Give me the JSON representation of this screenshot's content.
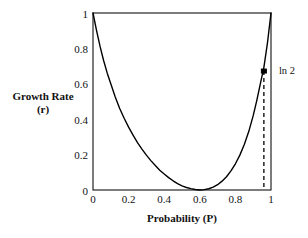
{
  "chart_data": {
    "type": "line",
    "title": "",
    "xlabel": "Probability (P)",
    "ylabel_line1": "Growth Rate",
    "ylabel_line2": "(r)",
    "xlim": [
      0,
      1
    ],
    "ylim": [
      0,
      1
    ],
    "grid": false,
    "legend": "none",
    "x_ticks": [
      "0",
      "0.2",
      "0.4",
      "0.6",
      "0.8",
      "1"
    ],
    "x_tick_values": [
      0,
      0.2,
      0.4,
      0.6,
      0.8,
      1
    ],
    "y_ticks": [
      "0",
      "0.2",
      "0.4",
      "0.6",
      "0.8",
      "1"
    ],
    "y_tick_values": [
      0,
      0.2,
      0.4,
      0.6,
      0.8,
      1
    ],
    "series": [
      {
        "name": "Growth Rate",
        "x": [
          0.0,
          0.02,
          0.04,
          0.06,
          0.08,
          0.1,
          0.125,
          0.15,
          0.175,
          0.2,
          0.225,
          0.25,
          0.275,
          0.3,
          0.325,
          0.35,
          0.375,
          0.4,
          0.425,
          0.45,
          0.475,
          0.5,
          0.525,
          0.55,
          0.575,
          0.6,
          0.625,
          0.65,
          0.675,
          0.7,
          0.725,
          0.75,
          0.775,
          0.8,
          0.825,
          0.85,
          0.875,
          0.9,
          0.92,
          0.94,
          0.96,
          0.98,
          1.0
        ],
        "y": [
          1.0,
          0.9,
          0.81,
          0.73,
          0.66,
          0.6,
          0.525,
          0.46,
          0.405,
          0.355,
          0.31,
          0.268,
          0.231,
          0.197,
          0.166,
          0.138,
          0.112,
          0.09,
          0.07,
          0.052,
          0.036,
          0.023,
          0.014,
          0.0075,
          0.003,
          0.0,
          0.002,
          0.007,
          0.016,
          0.03,
          0.05,
          0.075,
          0.108,
          0.148,
          0.197,
          0.257,
          0.33,
          0.42,
          0.505,
          0.6,
          0.693,
          0.83,
          1.0
        ]
      }
    ],
    "annotations": [
      {
        "label": "ln 2",
        "marker": true,
        "x": 0.96,
        "y": 0.672,
        "dropline": true,
        "dropline_to_y": 0.0
      }
    ]
  },
  "axes": {
    "frame": "box"
  }
}
